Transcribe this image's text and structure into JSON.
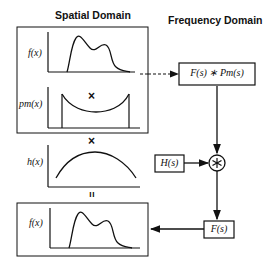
{
  "titles": {
    "spatial": "Spatial Domain",
    "frequency": "Frequency Domain"
  },
  "spatial_domain": {
    "plots": [
      {
        "label": "f(x)",
        "shape": "bimodal-signal"
      },
      {
        "label": "pm(x)",
        "shape": "truncated-u-window"
      },
      {
        "label": "h(x)",
        "shape": "arch-window"
      }
    ],
    "operators": [
      "×",
      "×",
      "="
    ],
    "result_plot": {
      "label": "f(x)",
      "shape": "bimodal-signal"
    }
  },
  "frequency_domain": {
    "boxes": {
      "convolution": "F(s) ∗ Pm(s)",
      "filter": "H(s)",
      "result": "F(s)"
    },
    "node": {
      "symbol": "⊛",
      "meaning": "convolution"
    }
  },
  "colors": {
    "line": "#111111",
    "background": "#ffffff"
  }
}
